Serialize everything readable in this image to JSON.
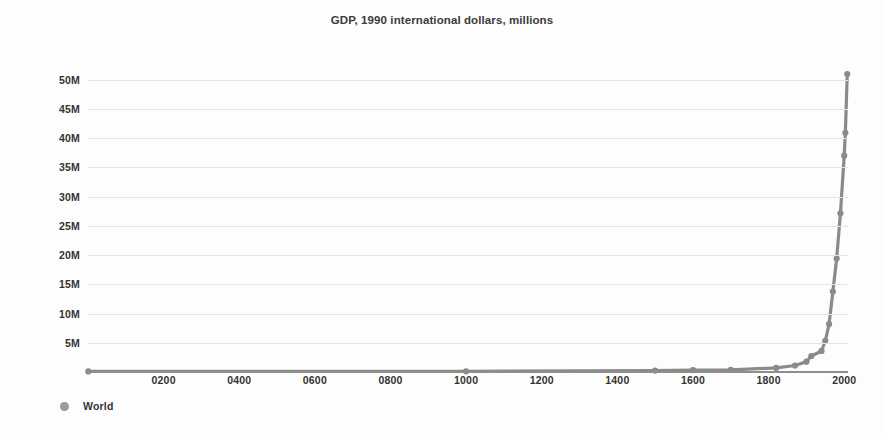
{
  "chart_data": {
    "type": "line",
    "title": "GDP, 1990 international dollars, millions",
    "xlabel": "",
    "ylabel": "",
    "xlim": [
      0,
      2010
    ],
    "ylim": [
      0,
      52000000
    ],
    "grid": true,
    "legend_position": "bottom-left",
    "y_tick_labels": [
      "5M",
      "10M",
      "15M",
      "20M",
      "25M",
      "30M",
      "35M",
      "40M",
      "45M",
      "50M"
    ],
    "y_tick_values": [
      5000000,
      10000000,
      15000000,
      20000000,
      25000000,
      30000000,
      35000000,
      40000000,
      45000000,
      50000000
    ],
    "x_tick_labels": [
      "0200",
      "0400",
      "0600",
      "0800",
      "1000",
      "1200",
      "1400",
      "1600",
      "1800",
      "2000"
    ],
    "x_tick_values": [
      200,
      400,
      600,
      800,
      1000,
      1200,
      1400,
      1600,
      1800,
      2000
    ],
    "series": [
      {
        "name": "World",
        "color": "#8a8a8a",
        "marker": "circle",
        "x": [
          1,
          1000,
          1500,
          1600,
          1700,
          1820,
          1870,
          1900,
          1913,
          1940,
          1950,
          1960,
          1970,
          1980,
          1990,
          2000,
          2003,
          2008
        ],
        "values": [
          105402,
          121208,
          248321,
          331462,
          371369,
          694442,
          1111968,
          1772000,
          2733365,
          3600000,
          5336101,
          8200000,
          13774000,
          19400000,
          27136000,
          37000000,
          40913000,
          50974000
        ]
      }
    ],
    "legend": [
      {
        "label": "World",
        "color": "#9a9a9a",
        "marker": "circle"
      }
    ]
  }
}
